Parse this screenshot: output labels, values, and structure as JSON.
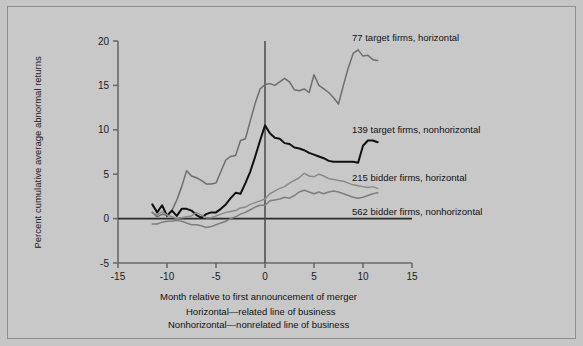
{
  "figure": {
    "background_color": "#c8c8c8",
    "border_color": "#8e8e8e"
  },
  "chart_data": {
    "type": "line",
    "title": "",
    "xlabel": "Month relative to first announcement of merger",
    "ylabel": "Percent cumulative average abnormal returns",
    "xlim": [
      -15,
      15
    ],
    "ylim": [
      -5,
      20
    ],
    "xticks": [
      "-15",
      "-10",
      "-5",
      "0",
      "5",
      "10",
      "15"
    ],
    "xtick_values": [
      -15,
      -10,
      -5,
      0,
      5,
      10,
      15
    ],
    "yticks": [
      "-5",
      "0",
      "5",
      "10",
      "15",
      "20"
    ],
    "ytick_values": [
      -5,
      0,
      5,
      10,
      15,
      20
    ],
    "grid": false,
    "legend_position": "right-inline-annotations",
    "annotations": [
      "Horizontal—related line of business",
      "Nonhorizontal—nonrelated line of business"
    ],
    "reference_lines": [
      {
        "name": "zero-return-line",
        "axis": "y",
        "value": 0,
        "color": "#2b2b2b"
      },
      {
        "name": "announcement-month-line",
        "axis": "x",
        "value": 0,
        "color": "#4a4a4a"
      }
    ],
    "series": [
      {
        "name": "77 target firms, horizontal",
        "label": "77 target firms, horizontal",
        "color": "#6e6e6e",
        "x": [
          -11.5,
          -11,
          -10.5,
          -10,
          -9.5,
          -9,
          -8.5,
          -8,
          -7.5,
          -7,
          -6.5,
          -6,
          -5.5,
          -5,
          -4.5,
          -4,
          -3.5,
          -3,
          -2.5,
          -2,
          -1.5,
          -1,
          -0.5,
          0,
          0.5,
          1,
          1.5,
          2,
          2.5,
          3,
          3.5,
          4,
          4.5,
          5,
          5.5,
          6,
          6.5,
          7,
          7.5,
          8,
          8.5,
          9,
          9.5,
          10,
          10.5,
          11,
          11.5
        ],
        "y": [
          0.7,
          0.2,
          0.5,
          0.4,
          0.9,
          2.1,
          3.6,
          5.4,
          4.8,
          4.6,
          4.3,
          3.9,
          3.9,
          4.0,
          5.3,
          6.6,
          7.0,
          7.1,
          8.8,
          9.0,
          11.0,
          13.0,
          14.6,
          15.1,
          15.2,
          15.0,
          15.4,
          15.8,
          15.4,
          14.5,
          14.4,
          14.6,
          14.2,
          16.2,
          15.0,
          14.6,
          14.2,
          13.6,
          12.9,
          15.0,
          17.0,
          18.6,
          19.0,
          18.3,
          18.4,
          17.9,
          17.8
        ]
      },
      {
        "name": "139 target firms, nonhorizontal",
        "label": "139 target firms, nonhorizontal",
        "color": "#101010",
        "x": [
          -11.5,
          -11,
          -10.5,
          -10,
          -9.5,
          -9,
          -8.5,
          -8,
          -7.5,
          -7,
          -6.5,
          -6,
          -5.5,
          -5,
          -4.5,
          -4,
          -3.5,
          -3,
          -2.5,
          -2,
          -1.5,
          -1,
          -0.5,
          0,
          0.5,
          1,
          1.5,
          2,
          2.5,
          3,
          3.5,
          4,
          4.5,
          5,
          5.5,
          6,
          6.5,
          7,
          7.5,
          8,
          8.5,
          9,
          9.5,
          10,
          10.5,
          11,
          11.5
        ],
        "y": [
          1.6,
          0.7,
          1.5,
          0.3,
          0.9,
          0.3,
          1.1,
          1.1,
          0.9,
          0.4,
          0.1,
          0.5,
          0.7,
          0.7,
          1.1,
          1.6,
          2.3,
          2.9,
          2.8,
          4.0,
          5.3,
          7.0,
          8.8,
          10.5,
          9.6,
          9.1,
          9.0,
          8.5,
          8.4,
          8.0,
          7.9,
          7.7,
          7.4,
          7.2,
          7.0,
          6.8,
          6.5,
          6.4,
          6.4,
          6.4,
          6.4,
          6.4,
          6.3,
          8.2,
          8.8,
          8.8,
          8.6
        ]
      },
      {
        "name": "215 bidder firms, horizontal",
        "label": "215 bidder firms, horizontal",
        "color": "#8a8a8a",
        "x": [
          -11.5,
          -11,
          -10.5,
          -10,
          -9.5,
          -9,
          -8.5,
          -8,
          -7.5,
          -7,
          -6.5,
          -6,
          -5.5,
          -5,
          -4.5,
          -4,
          -3.5,
          -3,
          -2.5,
          -2,
          -1.5,
          -1,
          -0.5,
          0,
          0.5,
          1,
          1.5,
          2,
          2.5,
          3,
          3.5,
          4,
          4.5,
          5,
          5.5,
          6,
          6.5,
          7,
          7.5,
          8,
          8.5,
          9,
          9.5,
          10,
          10.5,
          11,
          11.5
        ],
        "y": [
          0.7,
          0.4,
          0.8,
          0.4,
          0.2,
          0.0,
          0.1,
          0.2,
          0.3,
          0.7,
          0.4,
          0.1,
          0.1,
          0.3,
          0.5,
          0.7,
          0.8,
          0.9,
          1.2,
          1.3,
          1.6,
          1.8,
          2.0,
          2.2,
          2.8,
          3.1,
          3.4,
          3.6,
          4.0,
          4.3,
          4.6,
          5.1,
          4.8,
          4.7,
          5.0,
          4.8,
          4.5,
          4.4,
          4.3,
          4.2,
          4.0,
          3.8,
          3.7,
          3.6,
          3.5,
          3.6,
          3.4
        ]
      },
      {
        "name": "562 bidder firms, nonhorizontal",
        "label": "562 bidder firms, nonhorizontal",
        "color": "#7e7e7e",
        "x": [
          -11.5,
          -11,
          -10.5,
          -10,
          -9.5,
          -9,
          -8.5,
          -8,
          -7.5,
          -7,
          -6.5,
          -6,
          -5.5,
          -5,
          -4.5,
          -4,
          -3.5,
          -3,
          -2.5,
          -2,
          -1.5,
          -1,
          -0.5,
          0,
          0.5,
          1,
          1.5,
          2,
          2.5,
          3,
          3.5,
          4,
          4.5,
          5,
          5.5,
          6,
          6.5,
          7,
          7.5,
          8,
          8.5,
          9,
          9.5,
          10,
          10.5,
          11,
          11.5
        ],
        "y": [
          -0.6,
          -0.6,
          -0.4,
          -0.3,
          -0.3,
          -0.2,
          -0.3,
          -0.5,
          -0.7,
          -0.7,
          -0.8,
          -1.0,
          -0.9,
          -0.7,
          -0.5,
          -0.3,
          0.0,
          0.2,
          0.5,
          0.7,
          1.0,
          1.3,
          1.5,
          1.5,
          2.0,
          2.1,
          2.2,
          2.4,
          2.3,
          2.6,
          3.0,
          3.2,
          3.0,
          2.8,
          3.0,
          2.8,
          3.0,
          3.1,
          3.0,
          2.8,
          2.6,
          2.4,
          2.3,
          2.4,
          2.6,
          2.8,
          2.9
        ]
      }
    ]
  },
  "labels": {
    "series_0": "77 target firms, horizontal",
    "series_1": "139 target firms, nonhorizontal",
    "series_2": "215 bidder firms, horizontal",
    "series_3": "562 bidder firms, nonhorizontal",
    "xaxis_title": "Month relative to first announcement of merger",
    "yaxis_title": "Percent cumulative average abnormal returns",
    "caption_1": "Horizontal—related line of business",
    "caption_2": "Nonhorizontal—nonrelated line of business"
  }
}
